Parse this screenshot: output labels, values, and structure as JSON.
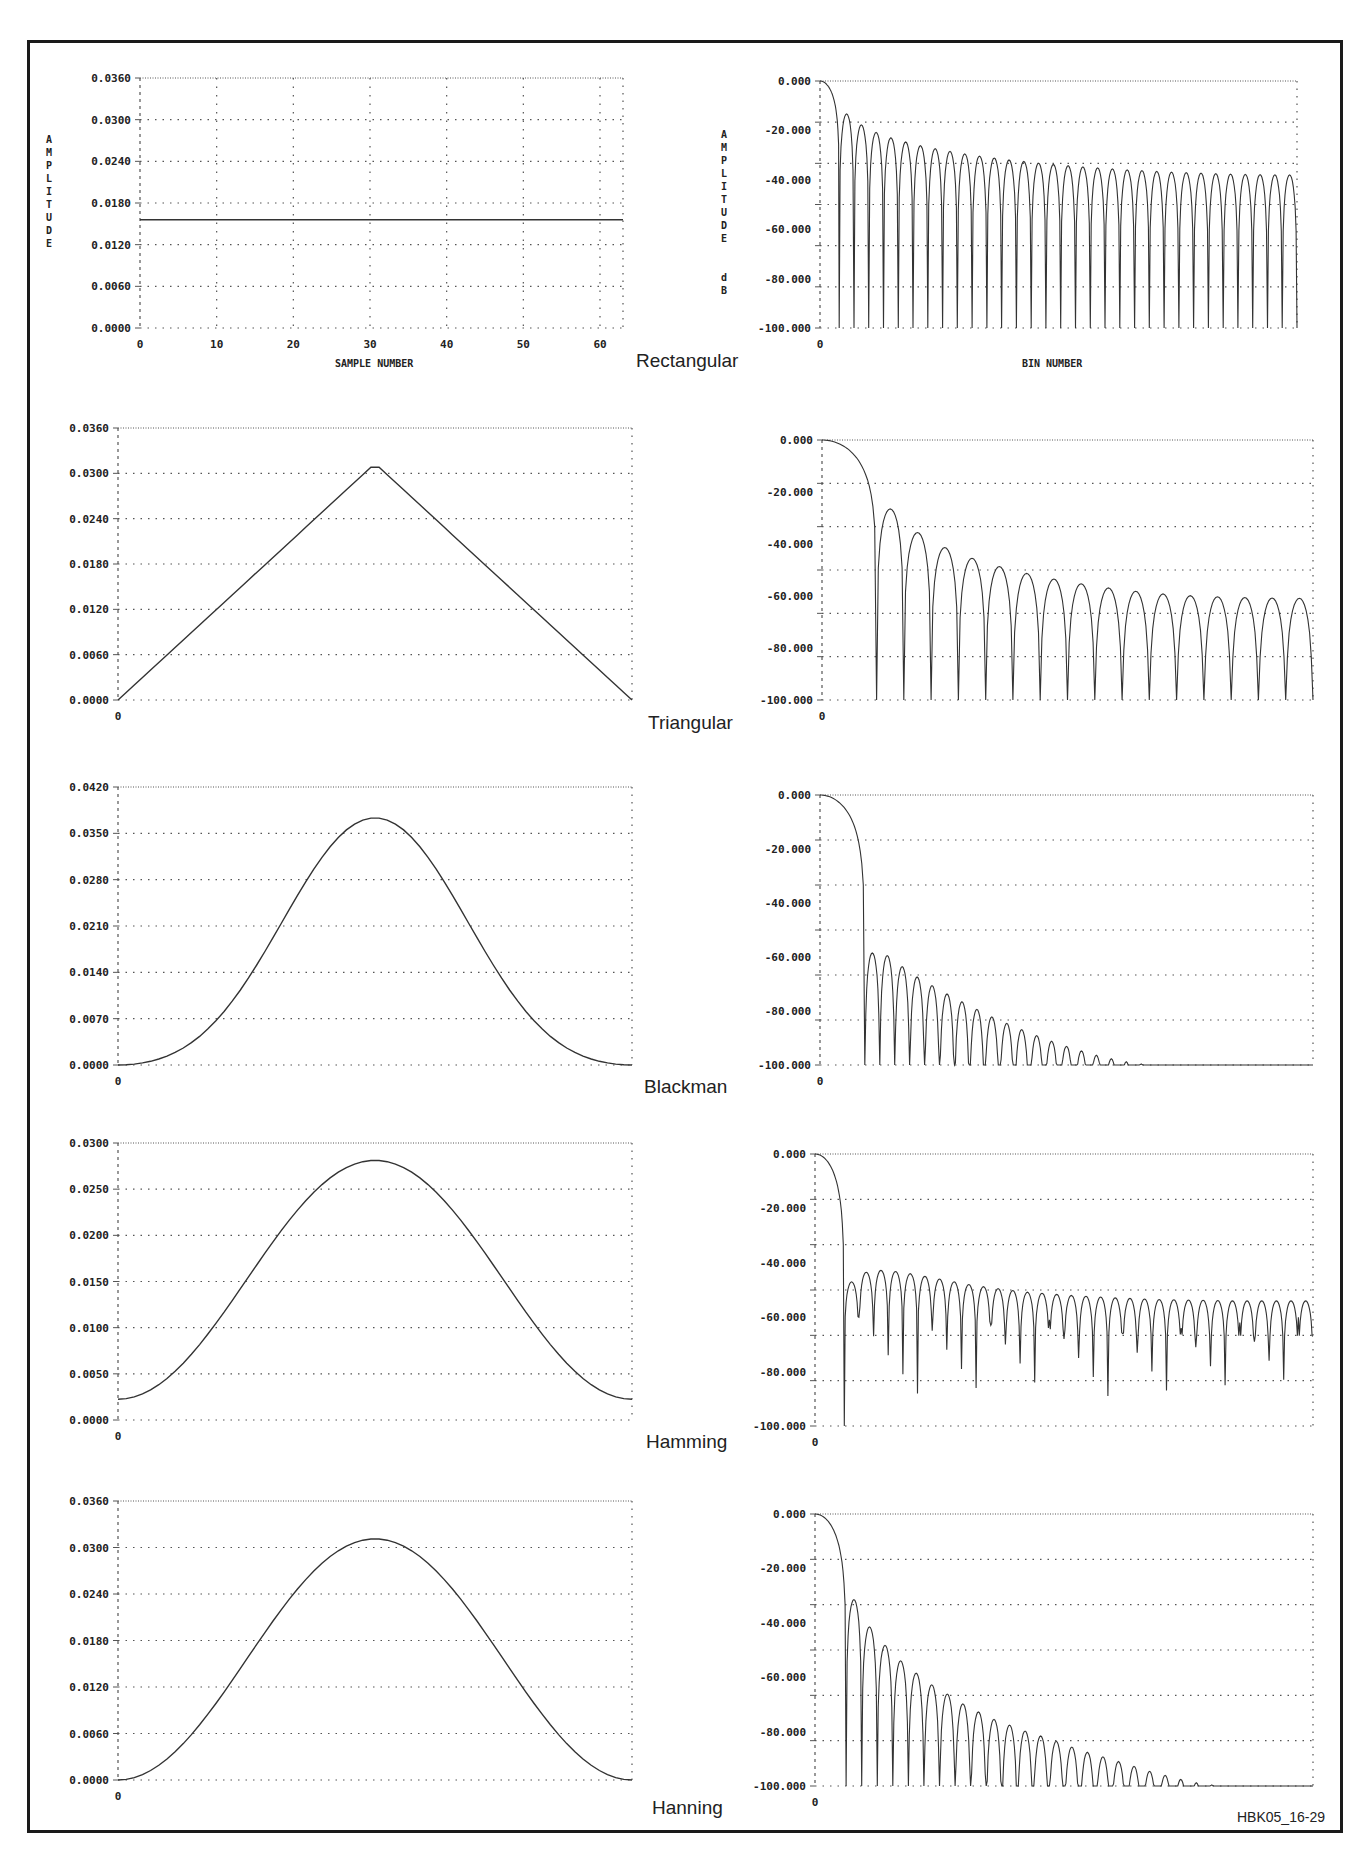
{
  "figure_id": "HBK05_16-29",
  "captions": [
    "Rectangular",
    "Triangular",
    "Blackman",
    "Hamming",
    "Hanning"
  ],
  "axis_labels": {
    "left_y": "AMPLITUDE",
    "right_y": "AMPLITUDE dB",
    "left_x": "SAMPLE NUMBER",
    "right_x": "BIN NUMBER"
  },
  "colors": {
    "line": "#333333",
    "grid": "#555555",
    "frame": "#1a1a1a"
  },
  "chart_data": [
    {
      "type": "line",
      "title": "Rectangular",
      "panel": "time",
      "xlabel": "SAMPLE NUMBER",
      "ylabel": "AMPLITUDE",
      "x_ticks": [
        "0",
        "10",
        "20",
        "30",
        "40",
        "50",
        "60"
      ],
      "y_ticks": [
        "0.0000",
        "0.0060",
        "0.0120",
        "0.0180",
        "0.0240",
        "0.0300",
        "0.0360"
      ],
      "xlim": [
        0,
        63
      ],
      "ylim": [
        0,
        0.036
      ],
      "grid": true,
      "window": "rectangular",
      "series": [
        {
          "name": "Rectangular window",
          "x": [
            0,
            63
          ],
          "values": [
            0.0156,
            0.0156
          ]
        }
      ]
    },
    {
      "type": "line",
      "title": "Rectangular",
      "panel": "frequency",
      "xlabel": "BIN NUMBER",
      "ylabel": "AMPLITUDE dB",
      "x_ticks": [
        "0"
      ],
      "y_ticks": [
        "-100.000",
        "-80.000",
        "-60.000",
        "-40.000",
        "-20.000",
        "0.000"
      ],
      "ylim": [
        -100,
        0
      ],
      "grid": true,
      "window": "rectangular",
      "sidelobe_peaks_db": [
        -13.3,
        -17.8,
        -20.8,
        -23,
        -24.7,
        -26.2,
        -27.4,
        -28.5,
        -29.5,
        -30.4,
        -31.2,
        -32,
        -32.6,
        -33.3,
        -33.8,
        -34.3,
        -34.8,
        -35.2,
        -35.6,
        -36,
        -36.3,
        -36.6,
        -36.9,
        -37.1,
        -37.3,
        -37.5,
        -37.7,
        -37.8,
        -37.9,
        -38,
        -38
      ]
    },
    {
      "type": "line",
      "title": "Triangular",
      "panel": "time",
      "x_ticks": [
        "0"
      ],
      "y_ticks": [
        "0.0000",
        "0.0060",
        "0.0120",
        "0.0180",
        "0.0240",
        "0.0300",
        "0.0360"
      ],
      "ylim": [
        0,
        0.036
      ],
      "grid": true,
      "window": "triangular",
      "series": [
        {
          "name": "Triangular window",
          "x": [
            0,
            31.5,
            63
          ],
          "values": [
            0.0,
            0.0308,
            0.0
          ]
        }
      ]
    },
    {
      "type": "line",
      "title": "Triangular",
      "panel": "frequency",
      "x_ticks": [
        "0"
      ],
      "y_ticks": [
        "-100.000",
        "-80.000",
        "-60.000",
        "-40.000",
        "-20.000",
        "0.000"
      ],
      "ylim": [
        -100,
        0
      ],
      "grid": true,
      "window": "triangular",
      "sidelobe_peaks_db": [
        -26.5,
        -35.6,
        -41.4,
        -45.5,
        -48.7,
        -51.3,
        -53.5,
        -55.3,
        -56.9,
        -58.2,
        -59.2,
        -59.9,
        -60.3,
        -60.6,
        -60.8,
        -60.9
      ]
    },
    {
      "type": "line",
      "title": "Blackman",
      "panel": "time",
      "x_ticks": [
        "0"
      ],
      "y_ticks": [
        "0.0000",
        "0.0070",
        "0.0140",
        "0.0210",
        "0.0280",
        "0.0350",
        "0.0420"
      ],
      "ylim": [
        0,
        0.042
      ],
      "grid": true,
      "window": "blackman",
      "series": [
        {
          "name": "Blackman window",
          "peak": 0.0373,
          "peak_x": 31.5,
          "end_values": [
            0.0,
            0.0
          ]
        }
      ]
    },
    {
      "type": "line",
      "title": "Blackman",
      "panel": "frequency",
      "x_ticks": [
        "0"
      ],
      "y_ticks": [
        "-100.000",
        "-80.000",
        "-60.000",
        "-40.000",
        "-20.000",
        "0.000"
      ],
      "ylim": [
        -100,
        0
      ],
      "grid": true,
      "window": "blackman",
      "sidelobe_peaks_db": [
        -58.5,
        -59.5,
        -63.6,
        -67.4,
        -70.6,
        -73.7,
        -76.6,
        -79.4,
        -82.2,
        -84.6,
        -86.9,
        -89.1,
        -91.2,
        -93.1,
        -94.8,
        -96.4,
        -97.7,
        -98.8,
        -99.6
      ],
      "floor_db": -100
    },
    {
      "type": "line",
      "title": "Hamming",
      "panel": "time",
      "x_ticks": [
        "0"
      ],
      "y_ticks": [
        "0.0000",
        "0.0050",
        "0.0100",
        "0.0150",
        "0.0200",
        "0.0250",
        "0.0300"
      ],
      "ylim": [
        0,
        0.03
      ],
      "grid": true,
      "window": "hamming",
      "series": [
        {
          "name": "Hamming window",
          "peak": 0.0281,
          "peak_x": 31.5,
          "end_values": [
            0.0023,
            0.0023
          ]
        }
      ]
    },
    {
      "type": "line",
      "title": "Hamming",
      "panel": "frequency",
      "x_ticks": [
        "0"
      ],
      "y_ticks": [
        "-100.000",
        "-80.000",
        "-60.000",
        "-40.000",
        "-20.000",
        "0.000"
      ],
      "ylim": [
        -100,
        0
      ],
      "grid": true,
      "window": "hamming",
      "sidelobe_peaks_db": [
        -47,
        -43.5,
        -42.8,
        -43.2,
        -44,
        -45,
        -46,
        -47,
        -48,
        -48.8,
        -49.5,
        -50.2,
        -50.8,
        -51.2,
        -51.6,
        -52,
        -52.3,
        -52.6,
        -52.9,
        -53.1,
        -53.3,
        -53.5,
        -53.6,
        -53.7,
        -53.8,
        -53.9,
        -54,
        -54,
        -54,
        -54,
        -54,
        -54
      ]
    },
    {
      "type": "line",
      "title": "Hanning",
      "panel": "time",
      "x_ticks": [
        "0"
      ],
      "y_ticks": [
        "0.0000",
        "0.0060",
        "0.0120",
        "0.0180",
        "0.0240",
        "0.0300",
        "0.0360"
      ],
      "ylim": [
        0,
        0.036
      ],
      "grid": true,
      "window": "hanning",
      "series": [
        {
          "name": "Hanning window",
          "peak": 0.0311,
          "peak_x": 31.5,
          "end_values": [
            0.0,
            0.0
          ]
        }
      ]
    },
    {
      "type": "line",
      "title": "Hanning",
      "panel": "frequency",
      "x_ticks": [
        "0"
      ],
      "y_ticks": [
        "-100.000",
        "-80.000",
        "-60.000",
        "-40.000",
        "-20.000",
        "0.000"
      ],
      "ylim": [
        -100,
        0
      ],
      "grid": true,
      "window": "hanning",
      "sidelobe_peaks_db": [
        -31.5,
        -41.5,
        -48.3,
        -54,
        -58.5,
        -62.8,
        -66.2,
        -69.8,
        -72.8,
        -75.5,
        -77.6,
        -79.8,
        -81.6,
        -83.6,
        -85.7,
        -87.6,
        -89.3,
        -91,
        -92.8,
        -94.6,
        -96.1,
        -97.6,
        -98.8,
        -99.6
      ],
      "floor_db": -100
    }
  ]
}
